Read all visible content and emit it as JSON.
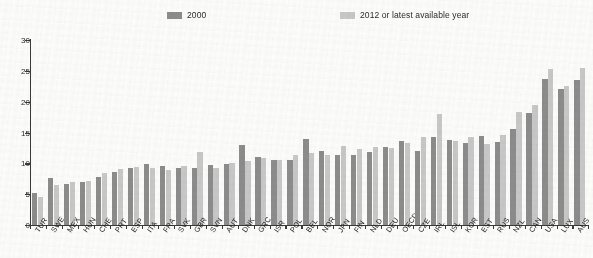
{
  "legend": {
    "items": [
      {
        "label": "2000",
        "color": "#8d8d8d",
        "name": "legend-2000"
      },
      {
        "label": "2012 or latest available year",
        "color": "#c9c9c9",
        "name": "legend-2012"
      }
    ]
  },
  "chart_data": {
    "type": "bar",
    "title": "",
    "subtitle": "",
    "xlabel": "",
    "ylabel": "",
    "ylim": [
      0,
      30
    ],
    "yticks": [
      0,
      5,
      10,
      15,
      20,
      25,
      30
    ],
    "grid": false,
    "legend_position": "top",
    "categories": [
      "TUR",
      "SWE",
      "MEX",
      "HUN",
      "CHE",
      "PRT",
      "ESP",
      "ITA",
      "FRA",
      "SVK",
      "GBR",
      "SVN",
      "AUT",
      "DNK",
      "GRC",
      "ISR",
      "POL",
      "BEL",
      "NOR",
      "JPN",
      "FIN",
      "NLD",
      "DEU",
      "OECD",
      "CZE",
      "IRL",
      "ISL",
      "KOR",
      "EST",
      "RUS",
      "NZL",
      "CAN",
      "USA",
      "LUX",
      "AUS"
    ],
    "series": [
      {
        "name": "2000",
        "color": "#8d8d8d",
        "values": [
          5.2,
          7.7,
          6.6,
          7.0,
          7.8,
          8.6,
          9.2,
          9.9,
          9.6,
          9.2,
          9.3,
          9.7,
          9.9,
          13.0,
          11.0,
          10.6,
          10.5,
          14.0,
          12.0,
          11.4,
          11.4,
          11.8,
          12.6,
          13.7,
          12.0,
          14.2,
          13.8,
          13.3,
          14.5,
          13.4,
          15.5,
          18.1,
          23.6,
          22.1,
          23.5
        ]
      },
      {
        "name": "2012 or latest available year",
        "color": "#c9c9c9",
        "values": [
          4.5,
          6.5,
          6.9,
          7.2,
          8.5,
          9.1,
          9.4,
          9.2,
          8.9,
          9.6,
          11.8,
          9.3,
          10.0,
          10.3,
          10.8,
          10.6,
          11.3,
          11.6,
          11.3,
          12.8,
          12.4,
          12.6,
          12.5,
          13.3,
          14.3,
          18.0,
          13.6,
          14.2,
          13.2,
          14.6,
          18.3,
          19.5,
          25.3,
          22.5,
          25.5
        ]
      }
    ]
  }
}
